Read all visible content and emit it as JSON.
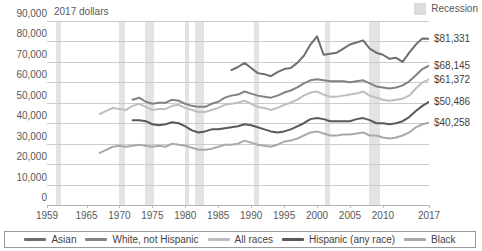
{
  "chart_data": {
    "type": "line",
    "title": "",
    "xlabel": "",
    "ylabel": "2017 dollars",
    "units_note": "2017 dollars",
    "ylim": [
      0,
      90000
    ],
    "xlim": [
      1959,
      2017
    ],
    "grid": true,
    "ytick_labels": [
      "90,000",
      "80,000",
      "70,000",
      "60,000",
      "50,000",
      "40,000",
      "30,000",
      "20,000",
      "10,000",
      "0"
    ],
    "ytick_values": [
      90000,
      80000,
      70000,
      60000,
      50000,
      40000,
      30000,
      20000,
      10000,
      0
    ],
    "xtick_labels": [
      "1959",
      "1965",
      "1970",
      "1975",
      "1980",
      "1985",
      "1990",
      "1995",
      "2000",
      "2005",
      "2010",
      "2017"
    ],
    "xtick_values": [
      1959,
      1965,
      1970,
      1975,
      1980,
      1985,
      1990,
      1995,
      2000,
      2005,
      2010,
      2017
    ],
    "legend_position": "bottom",
    "recession_label": "Recession",
    "recession_color": "#dcdcdc",
    "recession_bands": [
      [
        1960.3,
        1961.2
      ],
      [
        1969.9,
        1970.9
      ],
      [
        1973.9,
        1975.2
      ],
      [
        1980.0,
        1980.6
      ],
      [
        1981.5,
        1982.9
      ],
      [
        1990.5,
        1991.2
      ],
      [
        2001.2,
        2001.9
      ],
      [
        2007.9,
        2009.5
      ]
    ],
    "series": [
      {
        "name": "Asian",
        "color": "#6d6e70",
        "end_label": "$81,331",
        "end_value": 81331,
        "x": [
          1987,
          1988,
          1989,
          1990,
          1991,
          1992,
          1993,
          1994,
          1995,
          1996,
          1997,
          1998,
          1999,
          2000,
          2001,
          2002,
          2003,
          2004,
          2005,
          2006,
          2007,
          2008,
          2009,
          2010,
          2011,
          2012,
          2013,
          2014,
          2015,
          2016,
          2017
        ],
        "values": [
          66000,
          67500,
          69500,
          67000,
          64500,
          64000,
          63000,
          65000,
          66500,
          67000,
          69500,
          73000,
          78500,
          82500,
          73500,
          74000,
          74500,
          76500,
          78500,
          79500,
          80500,
          76500,
          74500,
          73500,
          71500,
          72000,
          70000,
          74500,
          78500,
          81500,
          81331
        ]
      },
      {
        "name": "White, not Hispanic",
        "color": "#808285",
        "end_label": "$68,145",
        "end_value": 68145,
        "x": [
          1972,
          1973,
          1974,
          1975,
          1976,
          1977,
          1978,
          1979,
          1980,
          1981,
          1982,
          1983,
          1984,
          1985,
          1986,
          1987,
          1988,
          1989,
          1990,
          1991,
          1992,
          1993,
          1994,
          1995,
          1996,
          1997,
          1998,
          1999,
          2000,
          2001,
          2002,
          2003,
          2004,
          2005,
          2006,
          2007,
          2008,
          2009,
          2010,
          2011,
          2012,
          2013,
          2014,
          2015,
          2016,
          2017
        ],
        "values": [
          51500,
          52500,
          50500,
          49500,
          50000,
          50000,
          51500,
          51000,
          49500,
          48500,
          48000,
          48000,
          49500,
          50500,
          52500,
          53500,
          54000,
          55500,
          54500,
          53500,
          53000,
          52500,
          53500,
          55000,
          56000,
          57500,
          59500,
          61000,
          61500,
          61000,
          60500,
          60500,
          60500,
          60000,
          60500,
          61000,
          59500,
          58000,
          57500,
          57000,
          57500,
          58500,
          60500,
          63500,
          66500,
          68145
        ]
      },
      {
        "name": "All races",
        "color": "#bcbec0",
        "end_label": "$61,372",
        "end_value": 61372,
        "x": [
          1967,
          1968,
          1969,
          1970,
          1971,
          1972,
          1973,
          1974,
          1975,
          1976,
          1977,
          1978,
          1979,
          1980,
          1981,
          1982,
          1983,
          1984,
          1985,
          1986,
          1987,
          1988,
          1989,
          1990,
          1991,
          1992,
          1993,
          1994,
          1995,
          1996,
          1997,
          1998,
          1999,
          2000,
          2001,
          2002,
          2003,
          2004,
          2005,
          2006,
          2007,
          2008,
          2009,
          2010,
          2011,
          2012,
          2013,
          2014,
          2015,
          2016,
          2017
        ],
        "values": [
          44500,
          46000,
          47500,
          47000,
          46500,
          48500,
          49500,
          48000,
          46500,
          47000,
          47000,
          48500,
          49000,
          47500,
          46500,
          45500,
          45500,
          46500,
          47500,
          49000,
          49500,
          50000,
          51000,
          49500,
          48000,
          47500,
          46500,
          47500,
          49000,
          50000,
          51500,
          53500,
          55000,
          55500,
          54000,
          53000,
          53000,
          53500,
          54000,
          54500,
          55500,
          53500,
          52500,
          51500,
          51000,
          51500,
          52000,
          53500,
          57000,
          60000,
          61372
        ]
      },
      {
        "name": "Hispanic (any race)",
        "color": "#58595b",
        "end_label": "$50,486",
        "end_value": 50486,
        "x": [
          1972,
          1973,
          1974,
          1975,
          1976,
          1977,
          1978,
          1979,
          1980,
          1981,
          1982,
          1983,
          1984,
          1985,
          1986,
          1987,
          1988,
          1989,
          1990,
          1991,
          1992,
          1993,
          1994,
          1995,
          1996,
          1997,
          1998,
          1999,
          2000,
          2001,
          2002,
          2003,
          2004,
          2005,
          2006,
          2007,
          2008,
          2009,
          2010,
          2011,
          2012,
          2013,
          2014,
          2015,
          2016,
          2017
        ],
        "values": [
          41500,
          41500,
          41000,
          39500,
          39000,
          39500,
          40500,
          40000,
          38500,
          36500,
          35500,
          36000,
          37000,
          37000,
          37500,
          38000,
          38500,
          39500,
          39000,
          38000,
          37000,
          36000,
          35500,
          36000,
          37000,
          38500,
          40000,
          42000,
          42500,
          42000,
          41000,
          41000,
          41000,
          41000,
          42000,
          42500,
          41500,
          40000,
          40000,
          39500,
          40000,
          41000,
          43000,
          46000,
          48500,
          50486
        ]
      },
      {
        "name": "Black",
        "color": "#a7a9ac",
        "end_label": "$40,258",
        "end_value": 40258,
        "x": [
          1967,
          1968,
          1969,
          1970,
          1971,
          1972,
          1973,
          1974,
          1975,
          1976,
          1977,
          1978,
          1979,
          1980,
          1981,
          1982,
          1983,
          1984,
          1985,
          1986,
          1987,
          1988,
          1989,
          1990,
          1991,
          1992,
          1993,
          1994,
          1995,
          1996,
          1997,
          1998,
          1999,
          2000,
          2001,
          2002,
          2003,
          2004,
          2005,
          2006,
          2007,
          2008,
          2009,
          2010,
          2011,
          2012,
          2013,
          2014,
          2015,
          2016,
          2017
        ],
        "values": [
          25500,
          27000,
          28500,
          29000,
          28500,
          29000,
          29500,
          29000,
          28500,
          29000,
          28500,
          30000,
          29500,
          29000,
          28000,
          27000,
          27000,
          27500,
          28500,
          29500,
          29500,
          30000,
          31500,
          30500,
          29500,
          29000,
          28500,
          29500,
          31000,
          31500,
          32500,
          34000,
          35500,
          36000,
          35000,
          34000,
          34000,
          34500,
          34500,
          35000,
          35500,
          34000,
          34000,
          33000,
          32500,
          33000,
          34000,
          35500,
          38000,
          39500,
          40258
        ]
      }
    ]
  },
  "axis": {
    "units_note": "2017 dollars"
  },
  "recession_key": {
    "label": "Recession"
  }
}
